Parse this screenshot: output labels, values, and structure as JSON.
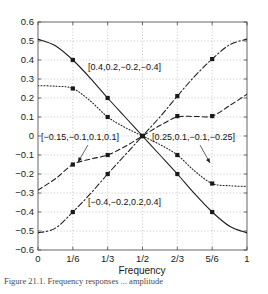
{
  "chart_data": {
    "type": "line",
    "title": "",
    "xlabel": "Frequency",
    "ylabel": "",
    "xlim": [
      0,
      1
    ],
    "ylim": [
      -0.6,
      0.6
    ],
    "grid": true,
    "legend_position": "inline-annotations",
    "xticks": [
      0,
      0.16666667,
      0.33333333,
      0.5,
      0.66666667,
      0.83333333,
      1
    ],
    "xticklabels": [
      "0",
      "1/6",
      "1/3",
      "1/2",
      "2/3",
      "5/6",
      "1"
    ],
    "yticks": [
      -0.6,
      -0.5,
      -0.4,
      -0.3,
      -0.2,
      -0.1,
      0,
      0.1,
      0.2,
      0.3,
      0.4,
      0.5,
      0.6
    ],
    "yticklabels": [
      "−0.6",
      "−0.5",
      "−0.4",
      "−0.3",
      "−0.2",
      "−0.1",
      "0",
      "0.1",
      "0.2",
      "0.3",
      "0.4",
      "0.5",
      "0.6"
    ],
    "marker": "filled-square",
    "marker_x": [
      0.16666667,
      0.33333333,
      0.5,
      0.66666667,
      0.83333333
    ],
    "series": [
      {
        "name": "[0.4,0.2,−0.2,−0.4]",
        "linestyle": "solid",
        "color": "#1a1a1a",
        "x": [
          0,
          0.0833,
          0.16666667,
          0.25,
          0.33333333,
          0.4167,
          0.5,
          0.5833,
          0.66666667,
          0.75,
          0.83333333,
          0.9167,
          1
        ],
        "y": [
          0.51,
          0.475,
          0.4,
          0.305,
          0.2,
          0.1,
          0.0,
          -0.1,
          -0.2,
          -0.305,
          -0.4,
          -0.475,
          -0.51
        ],
        "marker_y": [
          0.4,
          0.2,
          0.0,
          -0.2,
          -0.4
        ]
      },
      {
        "name": "[−0.15,−0.1,0.1,0.1]",
        "linestyle": "dotted",
        "color": "#1a1a1a",
        "x": [
          0,
          0.0833,
          0.16666667,
          0.25,
          0.33333333,
          0.4167,
          0.5,
          0.5833,
          0.66666667,
          0.75,
          0.83333333,
          0.9167,
          1
        ],
        "y": [
          0.265,
          0.262,
          0.25,
          0.185,
          0.1,
          0.045,
          0.0,
          -0.045,
          -0.1,
          -0.185,
          -0.25,
          -0.262,
          -0.265
        ],
        "marker_y": [
          0.25,
          0.1,
          0.0,
          -0.1,
          -0.25
        ]
      },
      {
        "name": "[0.25,0.1,−0.1,−0.25]",
        "linestyle": "dashed",
        "color": "#1a1a1a",
        "x": [
          0,
          0.0833,
          0.16666667,
          0.25,
          0.33333333,
          0.4167,
          0.5,
          0.5833,
          0.66666667,
          0.75,
          0.83333333,
          0.9167,
          1
        ],
        "y": [
          -0.285,
          -0.225,
          -0.15,
          -0.122,
          -0.1,
          -0.055,
          0.0,
          0.055,
          0.1,
          0.103,
          0.105,
          0.16,
          0.22
        ],
        "marker_y": [
          -0.15,
          -0.1,
          0.0,
          0.105,
          0.105
        ]
      },
      {
        "name": "[−0.4,−0.2,0.2,0.4]",
        "linestyle": "dashdot",
        "color": "#1a1a1a",
        "x": [
          0,
          0.0833,
          0.16666667,
          0.25,
          0.33333333,
          0.4167,
          0.5,
          0.5833,
          0.66666667,
          0.75,
          0.83333333,
          0.9167,
          1
        ],
        "y": [
          -0.51,
          -0.485,
          -0.4,
          -0.305,
          -0.2,
          -0.1,
          0.0,
          0.1,
          0.21,
          0.315,
          0.405,
          0.48,
          0.51
        ],
        "marker_y": [
          -0.4,
          -0.2,
          0.0,
          0.21,
          0.405
        ]
      }
    ],
    "annotations": [
      {
        "id": "annot-top",
        "text": "[0.4,0.2,−0.2,−0.4]",
        "x_px": 88,
        "y_px": 70,
        "leader": false
      },
      {
        "id": "annot-left",
        "text": "[−0.15,−0.1,0.1,0.1]",
        "x_px": 41,
        "y_px": 140,
        "leader": true
      },
      {
        "id": "annot-right",
        "text": "[0.25,0.1,−0.1,−0.25]",
        "x_px": 152,
        "y_px": 140,
        "leader": true
      },
      {
        "id": "annot-bottom",
        "text": "[−0.4,−0.2,0.2,0.4]",
        "x_px": 88,
        "y_px": 205,
        "leader": false
      }
    ]
  },
  "caption": {
    "text": "Figure 21.1. Frequency responses ... amplitude"
  }
}
